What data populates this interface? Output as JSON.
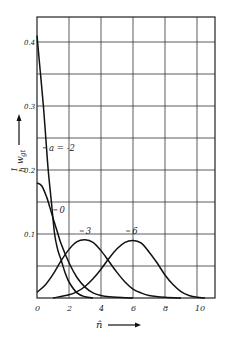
{
  "chart_data": {
    "type": "line",
    "title": "",
    "xlabel": "n̂",
    "ylabel": "1/ℏ w_gt",
    "xlim": [
      0,
      11.2
    ],
    "ylim": [
      0,
      0.43
    ],
    "grid": true,
    "x_ticks": [
      "0",
      "2",
      "4",
      "6",
      "8",
      "10"
    ],
    "x_tick_values": [
      0,
      2,
      4,
      6,
      8,
      10
    ],
    "y_ticks": [
      "0.1",
      "0.2",
      "0.3",
      "0.4"
    ],
    "y_tick_values": [
      0.1,
      0.2,
      0.3,
      0.4
    ],
    "y_grid_values": [
      0.05,
      0.1,
      0.15,
      0.2,
      0.25,
      0.3,
      0.35,
      0.4
    ],
    "origin_label": "0",
    "series": [
      {
        "name": "a = -2",
        "label": "a = -2",
        "label_pos": [
          0.75,
          0.23
        ],
        "points": [
          [
            0,
            0.41
          ],
          [
            0.2,
            0.355
          ],
          [
            0.4,
            0.3
          ],
          [
            0.55,
            0.25
          ],
          [
            0.7,
            0.2
          ],
          [
            0.9,
            0.15
          ],
          [
            1.1,
            0.1
          ],
          [
            1.3,
            0.075
          ],
          [
            1.5,
            0.06
          ],
          [
            1.75,
            0.04
          ],
          [
            2,
            0.025
          ],
          [
            2.5,
            0.008
          ],
          [
            3,
            0.002
          ],
          [
            3.5,
            0.0
          ]
        ]
      },
      {
        "name": "a = 0",
        "label": "0",
        "label_pos": [
          1.4,
          0.133
        ],
        "points": [
          [
            0,
            0.18
          ],
          [
            0.3,
            0.175
          ],
          [
            0.6,
            0.158
          ],
          [
            0.8,
            0.142
          ],
          [
            1,
            0.125
          ],
          [
            1.25,
            0.105
          ],
          [
            1.5,
            0.085
          ],
          [
            2,
            0.055
          ],
          [
            2.5,
            0.032
          ],
          [
            3,
            0.017
          ],
          [
            3.5,
            0.008
          ],
          [
            4,
            0.004
          ],
          [
            4.5,
            0.002
          ],
          [
            5,
            0.001
          ],
          [
            6,
            0.0
          ]
        ]
      },
      {
        "name": "a = 3",
        "label": "3",
        "label_pos": [
          3.05,
          0.1
        ],
        "points": [
          [
            0,
            0.009
          ],
          [
            0.5,
            0.02
          ],
          [
            1,
            0.037
          ],
          [
            1.5,
            0.058
          ],
          [
            2,
            0.076
          ],
          [
            2.5,
            0.088
          ],
          [
            3,
            0.091
          ],
          [
            3.5,
            0.087
          ],
          [
            4,
            0.074
          ],
          [
            4.5,
            0.057
          ],
          [
            5,
            0.04
          ],
          [
            5.5,
            0.025
          ],
          [
            6,
            0.014
          ],
          [
            6.5,
            0.008
          ],
          [
            7,
            0.004
          ],
          [
            8,
            0.001
          ],
          [
            9,
            0.0
          ]
        ]
      },
      {
        "name": "a = 6",
        "label": "6",
        "label_pos": [
          5.95,
          0.1
        ],
        "points": [
          [
            1,
            0.0
          ],
          [
            2,
            0.005
          ],
          [
            2.5,
            0.01
          ],
          [
            3,
            0.018
          ],
          [
            3.5,
            0.03
          ],
          [
            4,
            0.045
          ],
          [
            4.5,
            0.062
          ],
          [
            5,
            0.077
          ],
          [
            5.5,
            0.087
          ],
          [
            6,
            0.09
          ],
          [
            6.5,
            0.086
          ],
          [
            7,
            0.072
          ],
          [
            7.5,
            0.055
          ],
          [
            8,
            0.036
          ],
          [
            8.5,
            0.021
          ],
          [
            9,
            0.01
          ],
          [
            9.5,
            0.004
          ],
          [
            10,
            0.001
          ],
          [
            10.5,
            0.0
          ]
        ]
      }
    ]
  },
  "axes": {
    "x_axis_label": "n̂",
    "y_axis_label_num": "1",
    "y_axis_label_den": "ℏ",
    "y_axis_label_var": "w",
    "y_axis_label_sub": "gt"
  }
}
